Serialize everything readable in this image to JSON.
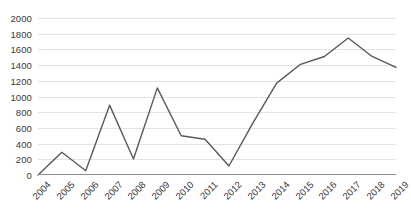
{
  "chart_data": {
    "type": "line",
    "title": "",
    "subtitle": "",
    "xlabel": "",
    "ylabel": "",
    "categories": [
      "2004",
      "2005",
      "2006",
      "2007",
      "2008",
      "2009",
      "2010",
      "2011",
      "2012",
      "2013",
      "2014",
      "2015",
      "2016",
      "2017",
      "2018",
      "2019"
    ],
    "values": [
      0,
      290,
      55,
      890,
      205,
      1110,
      500,
      455,
      115,
      660,
      1170,
      1410,
      1510,
      1745,
      1510,
      1370
    ],
    "series": [
      {
        "name": "",
        "values": [
          0,
          290,
          55,
          890,
          205,
          1110,
          500,
          455,
          115,
          660,
          1170,
          1410,
          1510,
          1745,
          1510,
          1370
        ]
      }
    ],
    "ylim": [
      0,
      2000
    ],
    "ytick_step": 200,
    "yticks": [
      0,
      200,
      400,
      600,
      800,
      1000,
      1200,
      1400,
      1600,
      1800,
      2000
    ],
    "ytick_labels": [
      "0",
      "200",
      "400",
      "600",
      "800",
      "1000",
      "1200",
      "1400",
      "1600",
      "1800",
      "2000"
    ],
    "xtick_labels": [
      "2004",
      "2005",
      "2006",
      "2007",
      "2008",
      "2009",
      "2010",
      "2011",
      "2012",
      "2013",
      "2014",
      "2015",
      "2016",
      "2017",
      "2018",
      "2019"
    ],
    "xtick_rotation_deg": -45,
    "grid": {
      "horizontal": true,
      "vertical": false,
      "color": "#E3E3E3"
    },
    "legend": {
      "visible": false,
      "position": "none",
      "entries": []
    },
    "line_color": "#595959",
    "line_width_px": 1.4,
    "markers": false,
    "axis_color": "#8C8C8C",
    "tick_label_color": "#3A3A3A",
    "background_color": "#FFFFFF",
    "annotations": []
  }
}
